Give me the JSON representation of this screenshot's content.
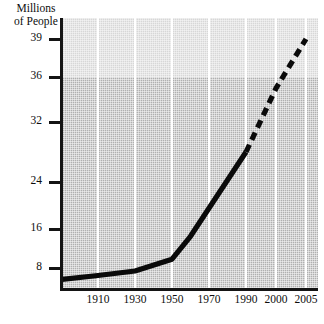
{
  "chart_data": {
    "type": "line",
    "title": "",
    "ylabel": "Millions of People",
    "xlabel": "",
    "grid": "vertical-white-gridlines",
    "legend": "none",
    "y_ticks": [
      8,
      16,
      24,
      32,
      36,
      39
    ],
    "y_tick_labels": [
      "8",
      "16",
      "24",
      "32",
      "36",
      "39"
    ],
    "x_ticks": [
      1910,
      1930,
      1950,
      1970,
      1990,
      2000,
      2005
    ],
    "x_tick_labels": [
      "1910",
      "1930",
      "1950",
      "1970",
      "1990",
      "2000",
      "2005"
    ],
    "axis_note": "both axes use non-uniform (compressed) tick spacing",
    "series": [
      {
        "name": "historical",
        "style": "solid",
        "x": [
          1900,
          1910,
          1930,
          1950,
          1960,
          1990
        ],
        "values": [
          3.5,
          5.0,
          6.8,
          9.8,
          14.5,
          28.0
        ]
      },
      {
        "name": "projected",
        "style": "dashed",
        "x": [
          1990,
          2000,
          2005
        ],
        "values": [
          28.0,
          35.0,
          39.0
        ]
      }
    ],
    "colors": {
      "line": "#0a0a0a",
      "plot_background": "#b0b0b0",
      "upper_band_background": "#d7d7d7",
      "gridline": "#ffffff",
      "axis": "#141414"
    }
  },
  "axis": {
    "y_title_line1": "Millions",
    "y_title_line2": "of People"
  }
}
